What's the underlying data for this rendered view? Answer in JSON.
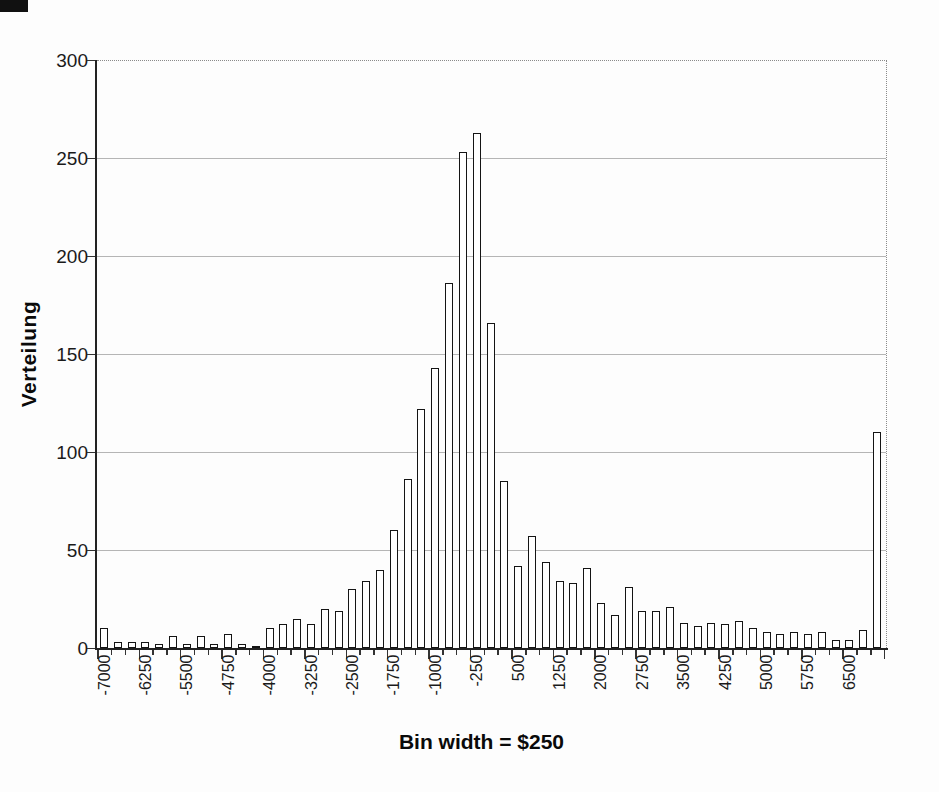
{
  "chart_data": {
    "type": "bar",
    "title": "",
    "xlabel": "Bin width = $250",
    "ylabel": "Verteilung",
    "ylim": [
      0,
      300
    ],
    "y_ticks": [
      0,
      50,
      100,
      150,
      200,
      250,
      300
    ],
    "grid": "horizontal",
    "legend": "none",
    "bin_width": 250,
    "categories": [
      -7000,
      -6750,
      -6500,
      -6250,
      -6000,
      -5750,
      -5500,
      -5250,
      -5000,
      -4750,
      -4500,
      -4250,
      -4000,
      -3750,
      -3500,
      -3250,
      -3000,
      -2750,
      -2500,
      -2250,
      -2000,
      -1750,
      -1500,
      -1250,
      -1000,
      -750,
      -500,
      -250,
      0,
      250,
      500,
      750,
      1000,
      1250,
      1500,
      1750,
      2000,
      2250,
      2500,
      2750,
      3000,
      3250,
      3500,
      3750,
      4000,
      4250,
      4500,
      4750,
      5000,
      5250,
      5500,
      5750,
      6000,
      6250,
      6500,
      6750,
      7000
    ],
    "values": [
      10,
      3,
      3,
      3,
      2,
      6,
      2,
      6,
      2,
      7,
      2,
      1,
      10,
      12,
      15,
      12,
      20,
      19,
      30,
      34,
      40,
      60,
      86,
      122,
      143,
      186,
      253,
      263,
      166,
      85,
      42,
      57,
      44,
      34,
      33,
      41,
      23,
      17,
      31,
      19,
      19,
      21,
      13,
      11,
      13,
      12,
      14,
      10,
      8,
      7,
      8,
      7,
      8,
      4,
      4,
      9,
      110
    ],
    "x_tick_labels": [
      "-7000",
      "-6250",
      "-5500",
      "-4750",
      "-4000",
      "-3250",
      "-2500",
      "-1750",
      "-1000",
      "-250",
      "500",
      "1250",
      "2000",
      "2750",
      "3500",
      "4250",
      "5000",
      "5750",
      "6500"
    ],
    "x_tick_label_every_n_bins": 3,
    "bar_style": {
      "fill": "#ffffff",
      "stroke": "#141414"
    },
    "gridline_color": "#b5b5b5",
    "axis_color": "#222222"
  }
}
